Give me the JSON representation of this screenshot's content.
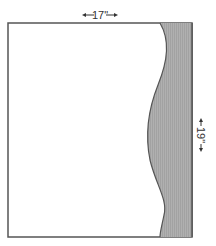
{
  "diagram": {
    "type": "pattern-piece",
    "width_label": "17\"",
    "height_label": "19\"",
    "colors": {
      "outline": "#555555",
      "shaded": "#aaaaaa",
      "background": "#ffffff",
      "text": "#333333"
    }
  }
}
